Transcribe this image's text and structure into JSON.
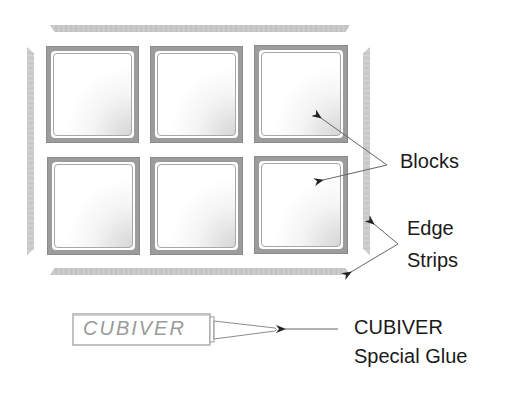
{
  "diagram": {
    "title": "",
    "components": {
      "blocks": {
        "label": "Blocks",
        "count": 6,
        "layout": {
          "rows": 2,
          "cols": 3
        }
      },
      "edge_strips": {
        "label_line1": "Edge",
        "label_line2": "Strips",
        "count": 4,
        "positions": [
          "top",
          "bottom",
          "left",
          "right"
        ]
      },
      "glue": {
        "tube_text": "CUBIVER",
        "label_line1": "CUBIVER",
        "label_line2": "Special Glue"
      }
    },
    "colors": {
      "frame": "#9c9c9c",
      "strip": "#c8c8c8",
      "text": "#1a1a1a",
      "tube_text": "#9a9a9a",
      "arrow": "#555555"
    }
  }
}
